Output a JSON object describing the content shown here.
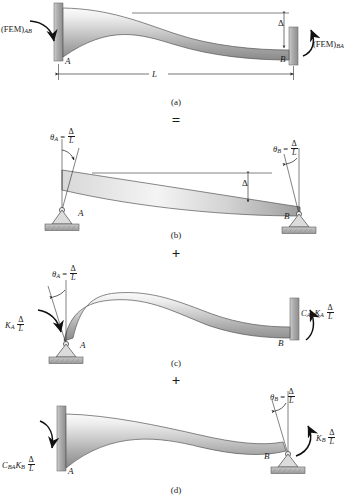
{
  "figure": {
    "colors": {
      "beam_light": "#f2f2f2",
      "beam_mid": "#c9c9c9",
      "beam_dark": "#8f8f8f",
      "wall": "#a8a8a8",
      "line": "#1a1a1a",
      "hatch": "#9a9a9a"
    },
    "symbols": {
      "delta": "Δ",
      "theta": "θ",
      "equals": "=",
      "plus": "+"
    }
  },
  "operators": {
    "equals": "=",
    "plus_1": "+",
    "plus_2": "+"
  },
  "captions": {
    "a": "(a)",
    "b": "(b)",
    "c": "(c)",
    "d": "(d)"
  },
  "panel_a": {
    "name": "fixed-fixed beam with relative displacement",
    "left_moment": "(FEM)",
    "left_moment_sub": "AB",
    "right_moment": "(FEM)",
    "right_moment_sub": "BA",
    "node_left": "A",
    "node_right": "B",
    "span_label": "L",
    "displacement_label": "Δ",
    "supports": {
      "left": "fixed",
      "right": "fixed"
    }
  },
  "panel_b": {
    "name": "rigid body rotation, pin and roller supports",
    "theta_left_symbol": "θ",
    "theta_left_sub": "A",
    "theta_left_eq": "=",
    "theta_left_num": "Δ",
    "theta_left_den": "L",
    "theta_right_symbol": "θ",
    "theta_right_sub": "B",
    "theta_right_eq": "=",
    "theta_right_num": "Δ",
    "theta_right_den": "L",
    "node_left": "A",
    "node_right": "B",
    "displacement_label": "Δ",
    "supports": {
      "left": "pin",
      "right": "pin"
    }
  },
  "panel_c": {
    "name": "unit rotation applied at A with carry-over to B",
    "theta_symbol": "θ",
    "theta_sub": "A",
    "theta_eq": "=",
    "theta_num": "Δ",
    "theta_den": "L",
    "left_moment_K": "K",
    "left_moment_K_sub": "A",
    "left_moment_num": "Δ",
    "left_moment_den": "L",
    "right_moment_C": "C",
    "right_moment_C_sub": "AB",
    "right_moment_K": "K",
    "right_moment_K_sub": "A",
    "right_moment_num": "Δ",
    "right_moment_den": "L",
    "node_left": "A",
    "node_right": "B",
    "supports": {
      "left": "pin",
      "right": "fixed"
    }
  },
  "panel_d": {
    "name": "unit rotation applied at B with carry-over to A",
    "theta_symbol": "θ",
    "theta_sub": "B",
    "theta_eq": "=",
    "theta_num": "Δ",
    "theta_den": "L",
    "left_moment_C": "C",
    "left_moment_C_sub": "BA",
    "left_moment_K": "K",
    "left_moment_K_sub": "B",
    "left_moment_num": "Δ",
    "left_moment_den": "L",
    "right_moment_K": "K",
    "right_moment_K_sub": "B",
    "right_moment_num": "Δ",
    "right_moment_den": "L",
    "node_left": "A",
    "node_right": "B",
    "supports": {
      "left": "fixed",
      "right": "pin"
    }
  }
}
